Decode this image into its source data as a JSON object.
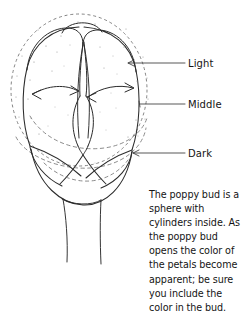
{
  "figure": {
    "ink_color": "#2b2b2b",
    "background_color": "#ffffff",
    "construction_line_color": "#6b6b6b"
  },
  "callouts": [
    {
      "id": "light",
      "label": "Light",
      "leader_from_x": 128,
      "leader_to_x": 185,
      "leader_y": 63
    },
    {
      "id": "middle",
      "label": "Middle",
      "leader_from_x": 140,
      "leader_to_x": 185,
      "leader_y": 104
    },
    {
      "id": "dark",
      "label": "Dark",
      "leader_from_x": 133,
      "leader_to_x": 185,
      "leader_y": 153
    }
  ],
  "caption": {
    "text": "The poppy bud is a sphere with cylinders inside. As the poppy bud opens the color of the petals become apparent; be sure you include the color in the bud.",
    "lines": [
      "The poppy bud is a",
      "sphere with cylinders",
      "inside. As the poppy",
      "bud opens the color",
      "of the petals become",
      "apparent; be sure",
      "you include the color",
      "in the bud."
    ]
  },
  "annotations": {
    "arrow_left_label": "petal-wrap-direction-left",
    "arrow_right_label": "petal-wrap-direction-right"
  }
}
